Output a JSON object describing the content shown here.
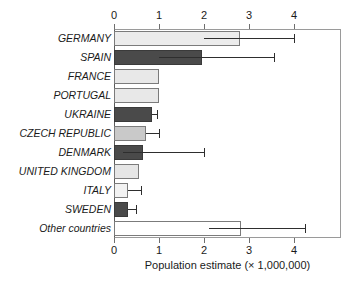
{
  "chart_data": {
    "type": "bar",
    "orientation": "horizontal",
    "title": "",
    "xlabel": "Population estimate (× 1,000,000)",
    "ylabel": "",
    "xlim": [
      0,
      5.04
    ],
    "xticks": [
      0,
      1,
      2,
      3,
      4
    ],
    "xtick_labels": [
      "0",
      "1",
      "2",
      "3",
      "4"
    ],
    "axis_top": true,
    "axis_bottom": true,
    "grid": false,
    "legend": null,
    "categories": [
      "GERMANY",
      "SPAIN",
      "FRANCE",
      "PORTUGAL",
      "UKRAINE",
      "CZECH REPUBLIC",
      "DENMARK",
      "UNITED KINGDOM",
      "ITALY",
      "SWEDEN",
      "Other countries"
    ],
    "values": [
      2.8,
      1.95,
      1.0,
      1.0,
      0.85,
      0.7,
      0.65,
      0.55,
      0.3,
      0.3,
      2.82
    ],
    "error_low": [
      2.0,
      1.0,
      null,
      null,
      0.85,
      0.7,
      0.2,
      null,
      0.3,
      0.3,
      2.1
    ],
    "error_high": [
      4.0,
      3.55,
      null,
      null,
      0.95,
      1.0,
      2.0,
      null,
      0.6,
      0.48,
      4.25
    ],
    "bar_colors": [
      "#ececec",
      "#4a4a4a",
      "#e8e8e8",
      "#e8e8e8",
      "#4a4a4a",
      "#c9c9c9",
      "#4a4a4a",
      "#e6e6e6",
      "#f2f2f2",
      "#4a4a4a",
      "#ffffff"
    ],
    "bars": [
      {
        "label": "GERMANY",
        "value": 2.8,
        "err_low": 2.0,
        "err_high": 4.0,
        "color": "#ececec",
        "dark": false
      },
      {
        "label": "SPAIN",
        "value": 1.95,
        "err_low": 1.0,
        "err_high": 3.55,
        "color": "#4a4a4a",
        "dark": true
      },
      {
        "label": "FRANCE",
        "value": 1.0,
        "err_low": null,
        "err_high": null,
        "color": "#e8e8e8",
        "dark": false
      },
      {
        "label": "PORTUGAL",
        "value": 1.0,
        "err_low": null,
        "err_high": null,
        "color": "#e8e8e8",
        "dark": false
      },
      {
        "label": "UKRAINE",
        "value": 0.85,
        "err_low": 0.85,
        "err_high": 0.95,
        "color": "#4a4a4a",
        "dark": true
      },
      {
        "label": "CZECH REPUBLIC",
        "value": 0.7,
        "err_low": 0.7,
        "err_high": 1.0,
        "color": "#c9c9c9",
        "dark": false
      },
      {
        "label": "DENMARK",
        "value": 0.65,
        "err_low": 0.2,
        "err_high": 2.0,
        "color": "#4a4a4a",
        "dark": true
      },
      {
        "label": "UNITED KINGDOM",
        "value": 0.55,
        "err_low": null,
        "err_high": null,
        "color": "#e6e6e6",
        "dark": false
      },
      {
        "label": "ITALY",
        "value": 0.3,
        "err_low": 0.3,
        "err_high": 0.6,
        "color": "#f2f2f2",
        "dark": false
      },
      {
        "label": "SWEDEN",
        "value": 0.3,
        "err_low": 0.3,
        "err_high": 0.48,
        "color": "#4a4a4a",
        "dark": true
      },
      {
        "label": "Other countries",
        "value": 2.82,
        "err_low": 2.1,
        "err_high": 4.25,
        "color": "#ffffff",
        "dark": false
      }
    ]
  }
}
